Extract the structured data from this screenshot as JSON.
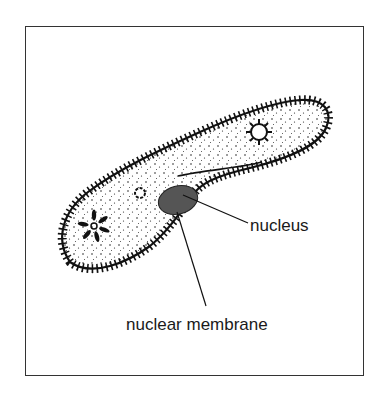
{
  "diagram": {
    "labels": {
      "nucleus": "nucleus",
      "nuclear_membrane": "nuclear membrane"
    },
    "colors": {
      "outline": "#111111",
      "nucleus_fill": "#555555",
      "background": "#ffffff",
      "frame": "#333333"
    }
  }
}
